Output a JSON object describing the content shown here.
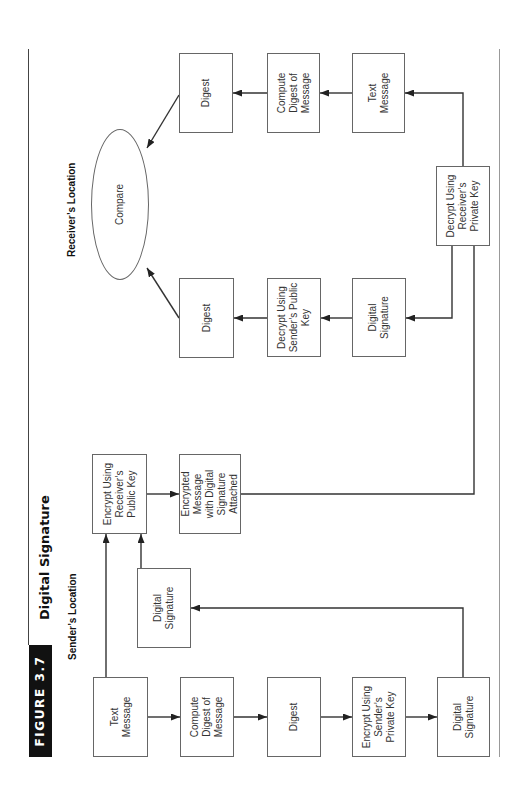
{
  "figure": {
    "label": "FIGURE 3.7",
    "title": "Digital Signature"
  },
  "sections": {
    "sender": "Sender’s Location",
    "receiver": "Receiver’s Location"
  },
  "sender": {
    "text_message": {
      "lines": [
        "Text",
        "Message"
      ]
    },
    "compute_digest": {
      "lines": [
        "Compute",
        "Digest of",
        "Message"
      ]
    },
    "digest": {
      "lines": [
        "Digest"
      ]
    },
    "encrypt_private": {
      "lines": [
        "Encrypt Using",
        "Sender’s",
        "Private Key"
      ]
    },
    "digital_signature": {
      "lines": [
        "Digital",
        "Signature"
      ]
    },
    "digital_signature_copy": {
      "lines": [
        "Digital",
        "Signature"
      ]
    },
    "encrypt_public": {
      "lines": [
        "Encrypt Using",
        "Receiver’s",
        "Public Key"
      ]
    },
    "encrypted_message": {
      "lines": [
        "Encrypted",
        "Message",
        "with Digital",
        "Signature",
        "Attached"
      ]
    }
  },
  "receiver": {
    "decrypt_private": {
      "lines": [
        "Decrypt Using",
        "Receiver’s",
        "Private Key"
      ]
    },
    "digital_signature": {
      "lines": [
        "Digital",
        "Signature"
      ]
    },
    "decrypt_public": {
      "lines": [
        "Decrypt Using",
        "Sender’s Public",
        "Key"
      ]
    },
    "digest_from_signature": {
      "lines": [
        "Digest"
      ]
    },
    "text_message": {
      "lines": [
        "Text",
        "Message"
      ]
    },
    "compute_digest": {
      "lines": [
        "Compute",
        "Digest of",
        "Message"
      ]
    },
    "digest_from_message": {
      "lines": [
        "Digest"
      ]
    },
    "compare": {
      "lines": [
        "Compare"
      ]
    }
  },
  "edges": [
    {
      "from": "sender.text_message",
      "to": "sender.compute_digest"
    },
    {
      "from": "sender.compute_digest",
      "to": "sender.digest"
    },
    {
      "from": "sender.digest",
      "to": "sender.encrypt_private"
    },
    {
      "from": "sender.encrypt_private",
      "to": "sender.digital_signature"
    },
    {
      "from": "sender.digital_signature",
      "to": "sender.digital_signature_copy"
    },
    {
      "from": "sender.text_message",
      "to": "sender.encrypt_public"
    },
    {
      "from": "sender.digital_signature_copy",
      "to": "sender.encrypt_public"
    },
    {
      "from": "sender.encrypt_public",
      "to": "sender.encrypted_message"
    },
    {
      "from": "sender.encrypted_message",
      "to": "receiver.decrypt_private"
    },
    {
      "from": "receiver.decrypt_private",
      "to": "receiver.digital_signature"
    },
    {
      "from": "receiver.decrypt_private",
      "to": "receiver.text_message"
    },
    {
      "from": "receiver.digital_signature",
      "to": "receiver.decrypt_public"
    },
    {
      "from": "receiver.decrypt_public",
      "to": "receiver.digest_from_signature"
    },
    {
      "from": "receiver.text_message",
      "to": "receiver.compute_digest"
    },
    {
      "from": "receiver.compute_digest",
      "to": "receiver.digest_from_message"
    },
    {
      "from": "receiver.digest_from_message",
      "to": "receiver.compare"
    },
    {
      "from": "receiver.digest_from_signature",
      "to": "receiver.compare"
    }
  ],
  "colors": {
    "label_bg": "#111111",
    "label_text": "#ffffff",
    "box_border": "#666666",
    "connector": "#333333",
    "bottom_rule": "#999999"
  }
}
